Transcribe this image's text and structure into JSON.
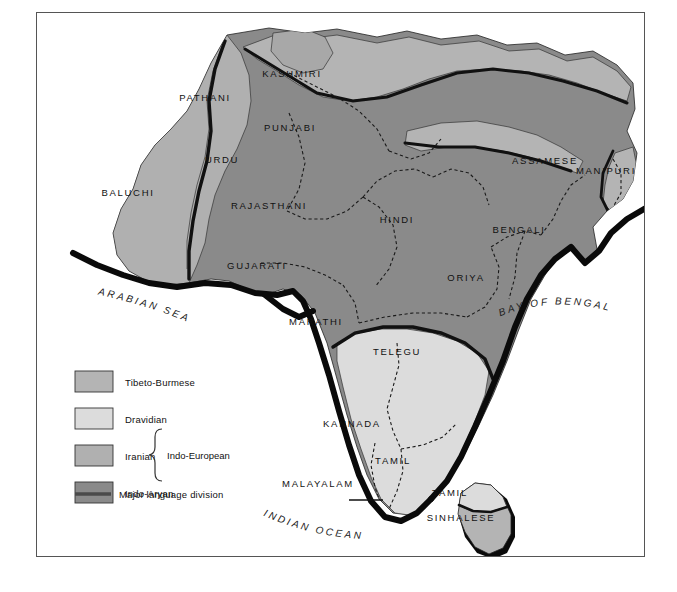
{
  "map": {
    "title": "South Asian Language Families",
    "regions": [
      {
        "name": "PATHANI",
        "x": 205,
        "y": 101,
        "family": "iranian"
      },
      {
        "name": "KASHMIRI",
        "x": 292,
        "y": 77,
        "family": "indo-aryan"
      },
      {
        "name": "PUNJABI",
        "x": 290,
        "y": 131,
        "family": "indo-aryan"
      },
      {
        "name": "URDU",
        "x": 222,
        "y": 163,
        "family": "indo-aryan"
      },
      {
        "name": "BALUCHI",
        "x": 128,
        "y": 196,
        "family": "iranian"
      },
      {
        "name": "RAJASTHANI",
        "x": 269,
        "y": 209,
        "family": "indo-aryan"
      },
      {
        "name": "HINDI",
        "x": 397,
        "y": 223,
        "family": "indo-aryan"
      },
      {
        "name": "GUJARATI",
        "x": 257,
        "y": 269,
        "family": "indo-aryan"
      },
      {
        "name": "ASSAMESE",
        "x": 545,
        "y": 164,
        "family": "indo-aryan"
      },
      {
        "name": "MANIPURI",
        "x": 606,
        "y": 174,
        "family": "tibeto-burmese"
      },
      {
        "name": "BENGALI",
        "x": 519,
        "y": 233,
        "family": "indo-aryan"
      },
      {
        "name": "ORIYA",
        "x": 466,
        "y": 281,
        "family": "indo-aryan"
      },
      {
        "name": "MARATHI",
        "x": 316,
        "y": 325,
        "family": "indo-aryan"
      },
      {
        "name": "TELEGU",
        "x": 397,
        "y": 355,
        "family": "dravidian"
      },
      {
        "name": "KANNADA",
        "x": 352,
        "y": 427,
        "family": "dravidian"
      },
      {
        "name": "TAMIL",
        "x": 393,
        "y": 464,
        "family": "dravidian"
      },
      {
        "name": "MALAYALAM",
        "x": 318,
        "y": 487,
        "family": "dravidian"
      },
      {
        "name": "TAMIL",
        "x": 450,
        "y": 496,
        "family": "dravidian"
      },
      {
        "name": "SINHALESE",
        "x": 461,
        "y": 521,
        "family": "tibeto-burmese"
      }
    ],
    "water_labels": [
      {
        "name": "ARABIAN SEA",
        "x": 68,
        "y": 287
      },
      {
        "name": "BAY OF BENGAL",
        "x": 487,
        "y": 297
      },
      {
        "name": "INDIAN OCEAN",
        "x": 248,
        "y": 512
      }
    ]
  },
  "legend": {
    "items": [
      {
        "label": "Tibeto-Burmese",
        "color": "#b4b4b4"
      },
      {
        "label": "Dravidian",
        "color": "#dcdcdc"
      },
      {
        "label": "Iranian",
        "color": "#b0b0b0"
      },
      {
        "label": "Indo-Aryan",
        "color": "#8a8a8a"
      }
    ],
    "group_label": "Indo-European",
    "line_label": "Major language division",
    "line_color": "#4a4a4a"
  },
  "colors": {
    "tibeto_burmese": "#b4b4b4",
    "dravidian": "#dcdcdc",
    "iranian": "#b0b0b0",
    "indo_aryan": "#8a8a8a",
    "division_line": "#111111",
    "border_dashed": "#1a1a1a",
    "frame": "#555555",
    "background": "#ffffff"
  }
}
